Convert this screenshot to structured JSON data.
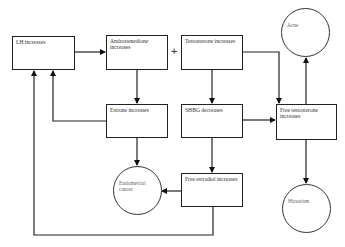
{
  "diagram": {
    "nodes": {
      "lh": {
        "label": "LH increases",
        "shape": "box"
      },
      "androstenedione": {
        "label": "Androstenedione increases",
        "shape": "box"
      },
      "testosterone": {
        "label": "Testosterone increases",
        "shape": "box"
      },
      "estrone": {
        "label": "Estrone increases",
        "shape": "box"
      },
      "shbg": {
        "label": "SHBG decreases",
        "shape": "box"
      },
      "free_testosterone": {
        "label": "Free testosterone increases",
        "shape": "box"
      },
      "free_estradiol": {
        "label": "Free estradiol increases",
        "shape": "box"
      },
      "acne": {
        "label": "Acne",
        "shape": "circle"
      },
      "endometrial_cancer": {
        "label": "Endometrial cancer",
        "shape": "circle"
      },
      "hirsutism": {
        "label": "Hirsutism",
        "shape": "circle"
      }
    },
    "plus_symbol": "+",
    "edges": [
      {
        "from": "LH increases",
        "to": "Androstenedione increases"
      },
      {
        "from": "Androstenedione increases",
        "to": "Estrone increases"
      },
      {
        "from": "Testosterone increases",
        "to": "SHBG decreases"
      },
      {
        "from": "Testosterone increases",
        "to": "Free testosterone increases"
      },
      {
        "from": "SHBG decreases",
        "to": "Free testosterone increases"
      },
      {
        "from": "SHBG decreases",
        "to": "Free estradiol increases"
      },
      {
        "from": "Estrone increases",
        "to": "LH increases"
      },
      {
        "from": "Estrone increases",
        "to": "Endometrial cancer"
      },
      {
        "from": "Free estradiol increases",
        "to": "Endometrial cancer"
      },
      {
        "from": "Free estradiol increases",
        "to": "LH increases"
      },
      {
        "from": "Free testosterone increases",
        "to": "Acne"
      },
      {
        "from": "Free testosterone increases",
        "to": "Hirsutism"
      }
    ]
  }
}
